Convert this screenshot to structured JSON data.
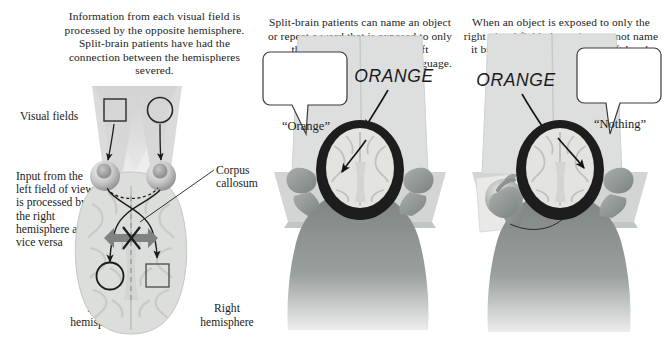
{
  "figure": {
    "background_color": "#ffffff",
    "ink_color": "#1b1b1b"
  },
  "panels": [
    {
      "id": "left",
      "caption": "Information from each visual field is processed by the opposite hemisphere. Split-brain patients have had the connection between the hemispheres severed.",
      "labels": {
        "visual_fields": "Visual fields",
        "input_note": "Input from the left field of view is processed by the right hemisphere and vice versa",
        "corpus_callosum": "Corpus callosum",
        "left_hemisphere": "Left hemisphere",
        "right_hemisphere": "Right hemisphere"
      },
      "stimuli": {
        "left_field_shape": "square",
        "right_field_shape": "circle"
      },
      "severed_marker": "X"
    },
    {
      "id": "middle",
      "caption": "Split-brain patients can name an object or repeat a word that is exposed to only the right visual field.  The left hemisphere is specialized for language.",
      "screen_word": "ORANGE",
      "speech_bubble": "“Orange”",
      "speech_side": "left"
    },
    {
      "id": "right",
      "caption": "When an object is exposed to only the right visual field, the patient cannot name it but can point to it with the left hand.",
      "screen_word": "ORANGE",
      "speech_bubble": "“Nothing”",
      "speech_side": "right",
      "hidden_object": "orange fruit held in left hand"
    }
  ],
  "colors": {
    "cone_fill": "#d8d8d8",
    "brain_fill": "#d9dbd8",
    "brain_stroke": "#b9bcb8",
    "arrow_band": "#7e8382",
    "screen_fill": "#dcdedd",
    "desk_fill": "#c9ccca",
    "skin_fill": "#9a9e9c",
    "shirt_fill": "#8e9391",
    "scalp_fill": "#1d1d1d",
    "bubble_fill": "#ffffff",
    "bubble_stroke": "#3a3a3a"
  }
}
